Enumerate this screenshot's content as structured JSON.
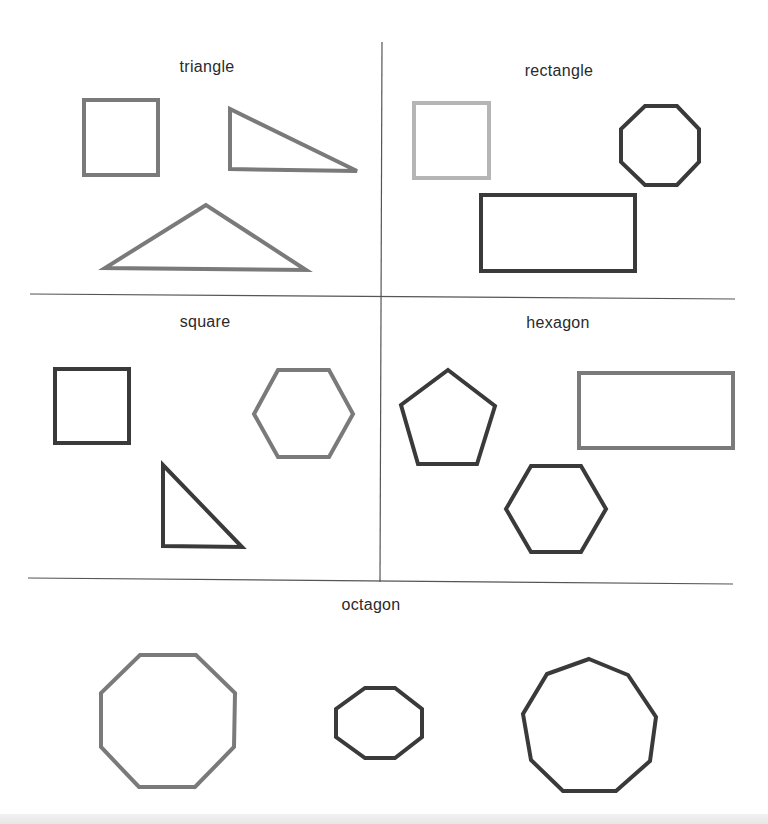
{
  "colors": {
    "background": "#ffffff",
    "divider": "#555555",
    "stroke_medium": "#7a7a7a",
    "stroke_light": "#b5b5b5",
    "stroke_dark": "#3a3a3a",
    "label": "#2a2a2a"
  },
  "panels": [
    {
      "label": "triangle",
      "shapes": [
        {
          "type": "square",
          "tone": "medium"
        },
        {
          "type": "right-triangle",
          "tone": "medium"
        },
        {
          "type": "obtuse-triangle",
          "tone": "medium"
        }
      ]
    },
    {
      "label": "rectangle",
      "shapes": [
        {
          "type": "square",
          "tone": "light"
        },
        {
          "type": "octagon",
          "tone": "dark"
        },
        {
          "type": "rectangle",
          "tone": "dark"
        }
      ]
    },
    {
      "label": "square",
      "shapes": [
        {
          "type": "square",
          "tone": "dark"
        },
        {
          "type": "hexagon",
          "tone": "medium"
        },
        {
          "type": "right-triangle",
          "tone": "dark"
        }
      ]
    },
    {
      "label": "hexagon",
      "shapes": [
        {
          "type": "pentagon",
          "tone": "dark"
        },
        {
          "type": "rectangle",
          "tone": "medium"
        },
        {
          "type": "hexagon",
          "tone": "dark"
        }
      ]
    },
    {
      "label": "octagon",
      "shapes": [
        {
          "type": "octagon",
          "tone": "medium"
        },
        {
          "type": "octagon",
          "tone": "dark"
        },
        {
          "type": "nonagon",
          "tone": "dark"
        }
      ]
    }
  ]
}
